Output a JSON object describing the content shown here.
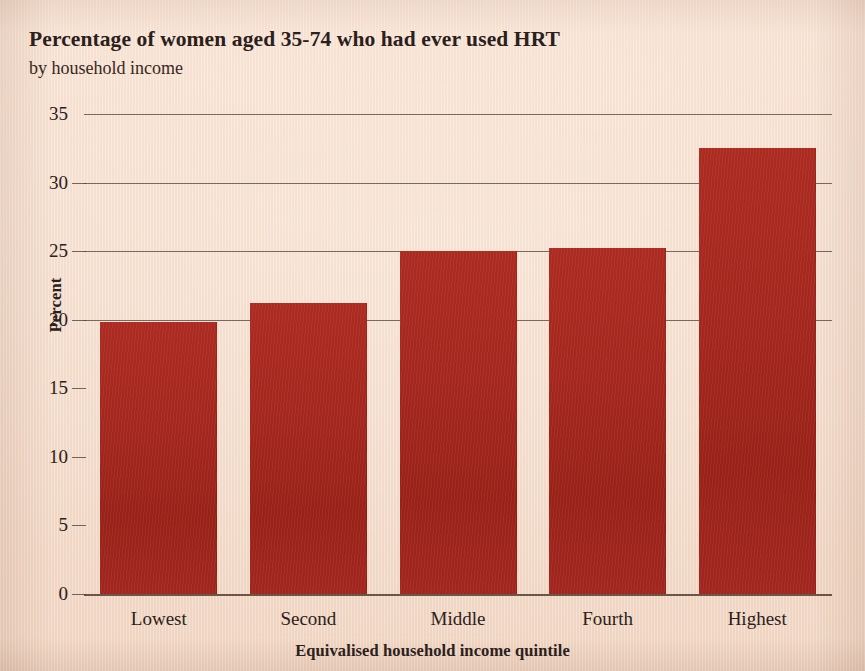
{
  "chart_data": {
    "type": "bar",
    "title": "Percentage of women aged 35-74 who had ever used HRT",
    "subtitle": "by household income",
    "xlabel": "Equivalised household income quintile",
    "ylabel": "Percent",
    "categories": [
      "Lowest",
      "Second",
      "Middle",
      "Fourth",
      "Highest"
    ],
    "values": [
      19.8,
      21.2,
      25.0,
      25.2,
      32.5
    ],
    "ylim": [
      0,
      35
    ],
    "ytick_labels": [
      "0",
      "5",
      "10",
      "15",
      "20",
      "25",
      "30",
      "35"
    ],
    "ytick_values": [
      0,
      5,
      10,
      15,
      20,
      25,
      30,
      35
    ],
    "gridline_values": [
      20,
      25,
      30,
      35
    ],
    "grid": true,
    "legend": "none",
    "bar_color": "#a8281f",
    "background_color": "#f3dac7",
    "axis_color": "#4a392f"
  }
}
